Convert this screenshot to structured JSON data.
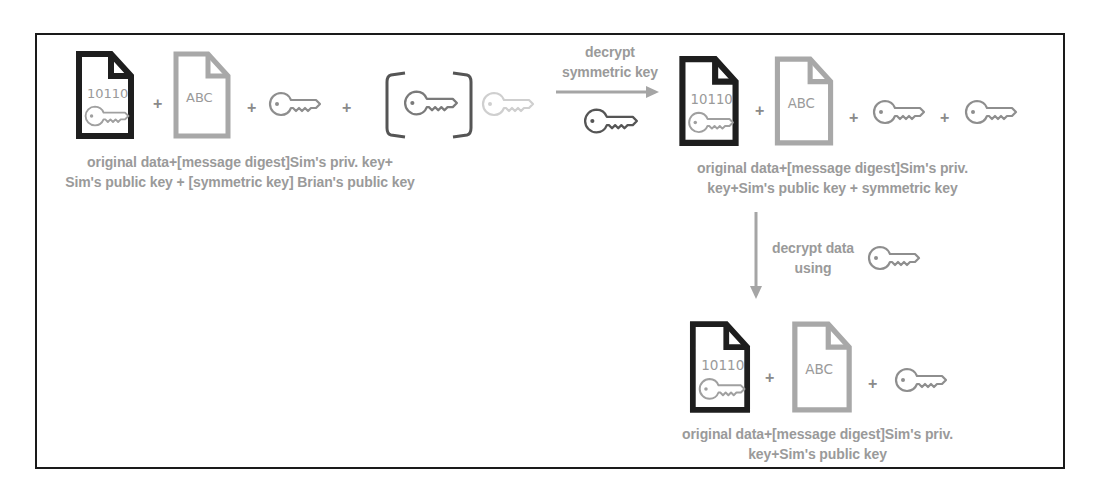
{
  "diagram": {
    "colors": {
      "frame": "#1a1a1a",
      "dark_icon": "#1e1e1e",
      "light_icon": "#a8a8a8",
      "key_stroke": "#8e8e8e",
      "faded_key": "#cfcfcf",
      "text": "#9a9a9a",
      "arrow": "#a5a5a5"
    },
    "stage1": {
      "data_doc_text": "10110",
      "digest_doc_text": "ABC",
      "plus_1": "+",
      "plus_2": "+",
      "plus_3": "+",
      "caption_line1": "original data+[message digest]Sim's priv. key+",
      "caption_line2": "Sim's public key + [symmetric key] Brian's public key"
    },
    "arrow1": {
      "label_line1": "decrypt",
      "label_line2": "symmetric key",
      "icon": "key-icon"
    },
    "stage2": {
      "data_doc_text": "10110",
      "digest_doc_text": "ABC",
      "plus_1": "+",
      "plus_2": "+",
      "plus_3": "+",
      "caption_line1": "original data+[message digest]Sim's priv.",
      "caption_line2": "key+Sim's public key + symmetric key"
    },
    "arrow2": {
      "label_line1": "decrypt data",
      "label_line2": "using",
      "icon": "key-icon"
    },
    "stage3": {
      "data_doc_text": "10110",
      "digest_doc_text": "ABC",
      "plus_1": "+",
      "plus_2": "+",
      "caption_line1": "original data+[message digest]Sim's priv.",
      "caption_line2": "key+Sim's public key"
    }
  }
}
